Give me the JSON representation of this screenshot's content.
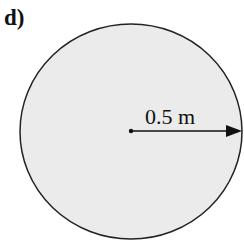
{
  "panel_label": "d)",
  "diagram": {
    "shape": "circle",
    "fill_color": "#ebebeb",
    "stroke_color": "#222222",
    "radius_label": "0.5 m",
    "elements": [
      "circle",
      "center-point",
      "radius-arrow"
    ]
  }
}
